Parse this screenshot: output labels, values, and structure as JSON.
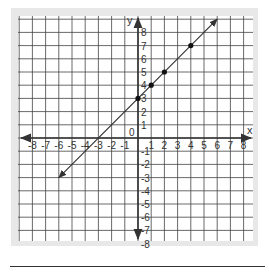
{
  "chart_data": {
    "type": "line",
    "title": "",
    "xlabel": "x",
    "ylabel": "y",
    "xlim": [
      -8,
      8
    ],
    "ylim": [
      -8,
      8
    ],
    "grid": true,
    "origin_label": "0",
    "x_ticks": [
      -8,
      -7,
      -6,
      -5,
      -4,
      -3,
      -2,
      -1,
      1,
      2,
      3,
      4,
      5,
      6,
      7,
      8
    ],
    "y_ticks": [
      8,
      7,
      6,
      5,
      4,
      3,
      2,
      1,
      -1,
      -2,
      -3,
      -4,
      -5,
      -6,
      -7,
      -8
    ],
    "series": [
      {
        "name": "line",
        "equation": "y = x + 3",
        "line_from": [
          -6,
          -3
        ],
        "line_to": [
          6,
          9
        ],
        "arrows_both_ends": true,
        "points": [
          [
            0,
            3
          ],
          [
            1,
            4
          ],
          [
            2,
            5
          ],
          [
            4,
            7
          ]
        ]
      }
    ]
  },
  "colors": {
    "panel": "#e8e8e8",
    "grid_bg": "#ffffff",
    "grid_line": "#444444",
    "axis": "#333333",
    "series": "#333333"
  }
}
